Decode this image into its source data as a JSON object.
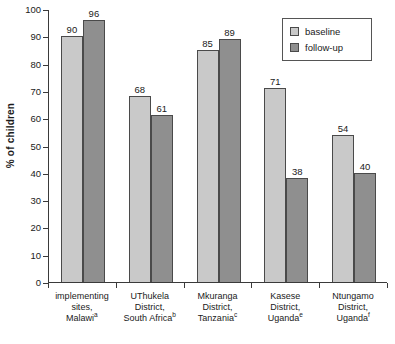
{
  "chart_data": {
    "type": "bar",
    "title": "",
    "xlabel": "",
    "ylabel": "% of children",
    "ylim": [
      0,
      100
    ],
    "yticks": [
      0,
      10,
      20,
      30,
      40,
      50,
      60,
      70,
      80,
      90,
      100
    ],
    "grid": false,
    "legend_position": "top-right",
    "categories": [
      "implementing sites, Malawi",
      "UThukela District, South Africa",
      "Mkuranga District, Tanzania",
      "Kasese District, Uganda",
      "Ntungamo District, Uganda"
    ],
    "category_lines": [
      [
        "implementing",
        "sites,",
        "Malawi"
      ],
      [
        "UThukela",
        "District,",
        "South Africa"
      ],
      [
        "Mkuranga",
        "District,",
        "Tanzania"
      ],
      [
        "Kasese",
        "District,",
        "Uganda"
      ],
      [
        "Ntungamo",
        "District,",
        "Uganda"
      ]
    ],
    "category_footnotes": [
      "a",
      "b",
      "c",
      "e",
      "f"
    ],
    "series": [
      {
        "name": "baseline",
        "color": "#c9c9c9",
        "values": [
          90,
          68,
          85,
          71,
          54
        ]
      },
      {
        "name": "follow-up",
        "color": "#8f8f8f",
        "values": [
          96,
          61,
          89,
          38,
          40
        ]
      }
    ]
  },
  "legend": {
    "items": [
      {
        "label": "baseline"
      },
      {
        "label": "follow-up"
      }
    ]
  },
  "caption": {
    "text": ""
  }
}
